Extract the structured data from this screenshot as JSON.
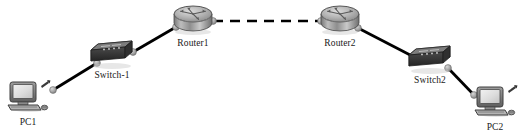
{
  "diagram": {
    "type": "network-topology",
    "background_color": "#ffffff",
    "label_color": "#1a1a1a",
    "link_color": "#000000",
    "connector_color": "#9a9a9a"
  },
  "nodes": [
    {
      "id": "pc1",
      "label": "PC1",
      "device_type": "pc",
      "icon": "desktop-computer-icon",
      "x": 28,
      "y": 98
    },
    {
      "id": "switch1",
      "label": "Switch-1",
      "device_type": "switch",
      "icon": "switch-icon",
      "x": 112,
      "y": 57
    },
    {
      "id": "router1",
      "label": "Router1",
      "device_type": "router",
      "icon": "router-icon",
      "x": 193,
      "y": 22
    },
    {
      "id": "router2",
      "label": "Router2",
      "device_type": "router",
      "icon": "router-icon",
      "x": 340,
      "y": 22
    },
    {
      "id": "switch2",
      "label": "Switch2",
      "device_type": "switch",
      "icon": "switch-icon",
      "x": 430,
      "y": 62
    },
    {
      "id": "pc2",
      "label": "PC2",
      "device_type": "pc",
      "icon": "desktop-computer-icon",
      "x": 495,
      "y": 103
    }
  ],
  "links": [
    {
      "id": "link-pc1-switch1",
      "from": "pc1",
      "to": "switch1",
      "style": "solid",
      "media": "ethernet",
      "x1": 53,
      "y1": 90,
      "x2": 97,
      "y2": 63
    },
    {
      "id": "link-switch1-router1",
      "from": "switch1",
      "to": "router1",
      "style": "solid",
      "media": "ethernet",
      "x1": 133,
      "y1": 52,
      "x2": 176,
      "y2": 27
    },
    {
      "id": "link-router1-router2",
      "from": "router1",
      "to": "router2",
      "style": "dashed",
      "media": "serial",
      "x1": 213,
      "y1": 21,
      "x2": 321,
      "y2": 21
    },
    {
      "id": "link-router2-switch2",
      "from": "router2",
      "to": "switch2",
      "style": "solid",
      "media": "ethernet",
      "x1": 358,
      "y1": 28,
      "x2": 414,
      "y2": 57
    },
    {
      "id": "link-switch2-pc2",
      "from": "switch2",
      "to": "pc2",
      "style": "solid",
      "media": "ethernet",
      "x1": 448,
      "y1": 68,
      "x2": 474,
      "y2": 95
    }
  ]
}
